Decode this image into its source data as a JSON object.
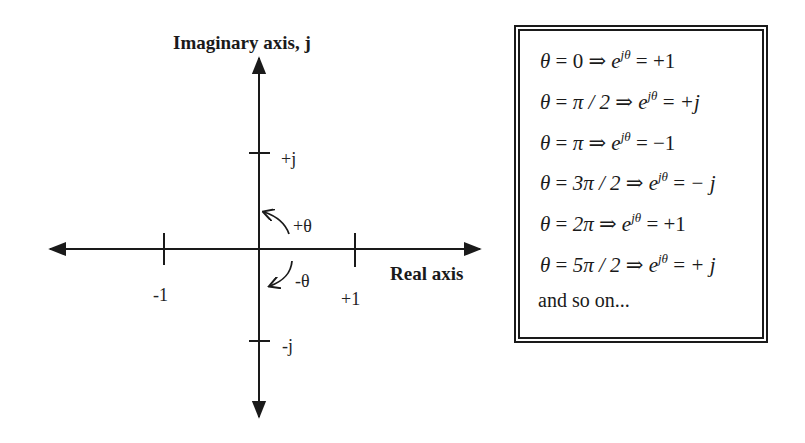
{
  "diagram": {
    "axes": {
      "vertical_label": "Imaginary axis, j",
      "horizontal_label": "Real axis"
    },
    "ticks": {
      "neg_real": "-1",
      "pos_real": "+1",
      "pos_imag": "+j",
      "neg_imag": "-j"
    },
    "rotation": {
      "positive": "+θ",
      "negative": "-θ"
    }
  },
  "equations": {
    "rows": [
      {
        "theta": "0",
        "result": "+1"
      },
      {
        "theta": "π / 2",
        "result": "+j"
      },
      {
        "theta": "π",
        "result": "−1"
      },
      {
        "theta": "3π / 2",
        "result": "− j"
      },
      {
        "theta": "2π",
        "result": "+1"
      },
      {
        "theta": "5π / 2",
        "result": "+ j"
      }
    ],
    "theta_sym": "θ",
    "eq_sym": " = ",
    "implies": " ⇒ ",
    "e": "e",
    "exponent": "jθ",
    "trailer": "and so on..."
  }
}
